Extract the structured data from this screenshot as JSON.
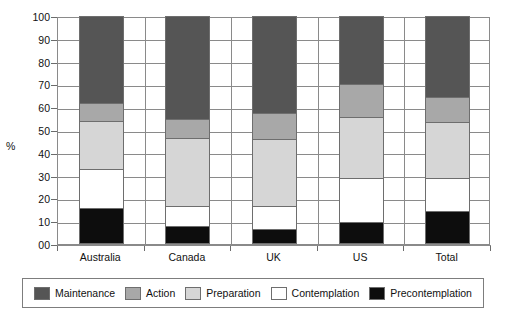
{
  "chart_data": {
    "type": "bar",
    "subtype": "stacked-bar-100-percent",
    "title": "",
    "xlabel": "",
    "ylabel": "%",
    "ylim": [
      0,
      100
    ],
    "yticks": [
      "00",
      "10",
      "20",
      "30",
      "40",
      "50",
      "60",
      "70",
      "80",
      "90",
      "100"
    ],
    "ytick_values": [
      0,
      10,
      20,
      30,
      40,
      50,
      60,
      70,
      80,
      90,
      100
    ],
    "grid": "horizontal",
    "legend_position": "bottom",
    "categories": [
      "Australia",
      "Canada",
      "UK",
      "US",
      "Total"
    ],
    "stack_order_bottom_to_top": [
      "Precontemplation",
      "Contemplation",
      "Preparation",
      "Action",
      "Maintenance"
    ],
    "series": [
      {
        "name": "Precontemplation",
        "color": "#0d0d0d",
        "values": [
          16.0,
          8.0,
          6.5,
          9.5,
          14.5
        ]
      },
      {
        "name": "Contemplation",
        "color": "#ffffff",
        "values": [
          17.0,
          8.5,
          10.0,
          19.5,
          14.5
        ]
      },
      {
        "name": "Preparation",
        "color": "#d6d6d6",
        "values": [
          21.0,
          30.0,
          29.5,
          26.5,
          24.5
        ]
      },
      {
        "name": "Action",
        "color": "#a8a8a8",
        "values": [
          8.0,
          8.5,
          11.5,
          14.5,
          11.0
        ]
      },
      {
        "name": "Maintenance",
        "color": "#555555",
        "values": [
          38.0,
          45.0,
          42.5,
          30.0,
          35.5
        ]
      }
    ],
    "cumulative_tops": {
      "Australia": [
        16.0,
        33.0,
        54.0,
        62.0,
        100.0
      ],
      "Canada": [
        8.0,
        16.5,
        46.5,
        55.0,
        100.0
      ],
      "UK": [
        6.5,
        16.5,
        46.0,
        57.5,
        100.0
      ],
      "US": [
        9.5,
        29.0,
        55.5,
        70.0,
        100.0
      ],
      "Total": [
        14.5,
        29.0,
        53.5,
        64.5,
        100.0
      ]
    }
  },
  "axis": {
    "y_title": "%"
  },
  "legend": {
    "items": [
      {
        "label": "Maintenance",
        "color": "#555555"
      },
      {
        "label": "Action",
        "color": "#a8a8a8"
      },
      {
        "label": "Preparation",
        "color": "#d6d6d6"
      },
      {
        "label": "Contemplation",
        "color": "#ffffff"
      },
      {
        "label": "Precontemplation",
        "color": "#0d0d0d"
      }
    ]
  }
}
